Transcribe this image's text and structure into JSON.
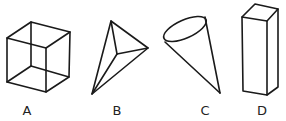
{
  "figure": {
    "shapes": [
      {
        "id": "A",
        "label": "A",
        "name": "cube",
        "label_x": 27
      },
      {
        "id": "B",
        "label": "B",
        "name": "triangular-pyramid",
        "label_x": 117
      },
      {
        "id": "C",
        "label": "C",
        "name": "cone",
        "label_x": 205
      },
      {
        "id": "D",
        "label": "D",
        "name": "rectangular-prism",
        "label_x": 262
      }
    ],
    "stroke_color": "#1a1a1a"
  }
}
